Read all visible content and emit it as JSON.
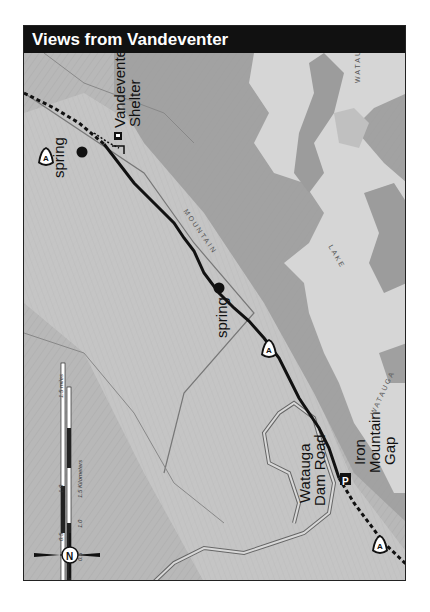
{
  "header": {
    "title": "Views from Vandeventer"
  },
  "map": {
    "orientation": "rotated 90° (north points left)",
    "labels": {
      "shelter_line1": "Vandeventer",
      "shelter_line2": "Shelter",
      "spring_north": "spring",
      "spring_center": "spring",
      "gap_line1": "Iron",
      "gap_line2": "Mountain",
      "gap_line3": "Gap",
      "road_line1": "Watauga",
      "road_line2": "Dam Road",
      "trail_text": "MOUNTAIN",
      "lake_word1": "WATAUGA",
      "lake_word2": "LAKE",
      "lake_word3": "WATAUGA"
    },
    "markers": {
      "at_symbol": "A",
      "parking_symbol": "P",
      "compass_letter": "N"
    },
    "scale": {
      "miles_ticks": [
        "0",
        "0.5",
        "1.0",
        "1.5 miles"
      ],
      "km_ticks": [
        "0",
        "0.5",
        "1.0",
        "1.5 Kilometers"
      ]
    },
    "colors": {
      "header_bg": "#111111",
      "trail": "#111111",
      "lake": "#d6d6d6",
      "terrain": "#b4b4b4"
    }
  }
}
